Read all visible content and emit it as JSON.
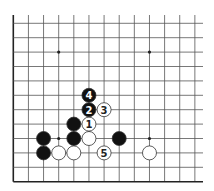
{
  "diagram": {
    "type": "go-board-fragment",
    "columns": 13,
    "rows": 12,
    "origin_x": 13.3,
    "origin_y": 23.3,
    "spacing_x": 15.13,
    "spacing_y": 14.4,
    "top_edge_y": 15,
    "right_edge_x": 203,
    "edges": {
      "left": "board-edge",
      "bottom": "board-edge",
      "top": "open",
      "right": "open"
    },
    "colors": {
      "line": "#555555",
      "edge": "#222222",
      "black": "#111111",
      "white": "#ffffff",
      "stone_outline": "#333333"
    },
    "hoshi": [
      {
        "col": 3,
        "row": 2
      },
      {
        "col": 9,
        "row": 2
      },
      {
        "col": 3,
        "row": 8
      },
      {
        "col": 9,
        "row": 8
      }
    ],
    "stones": [
      {
        "color": "black",
        "col": 2,
        "row": 8,
        "label": ""
      },
      {
        "color": "black",
        "col": 2,
        "row": 9,
        "label": ""
      },
      {
        "color": "white",
        "col": 3,
        "row": 9,
        "label": ""
      },
      {
        "color": "white",
        "col": 4,
        "row": 9,
        "label": ""
      },
      {
        "color": "black",
        "col": 4,
        "row": 7,
        "label": ""
      },
      {
        "color": "black",
        "col": 4,
        "row": 8,
        "label": ""
      },
      {
        "color": "white",
        "col": 5,
        "row": 8,
        "label": ""
      },
      {
        "color": "white",
        "col": 5,
        "row": 7,
        "label": "1"
      },
      {
        "color": "black",
        "col": 5,
        "row": 6,
        "label": "2"
      },
      {
        "color": "white",
        "col": 6,
        "row": 6,
        "label": "3"
      },
      {
        "color": "black",
        "col": 5,
        "row": 5,
        "label": "4"
      },
      {
        "color": "white",
        "col": 6,
        "row": 9,
        "label": "5"
      },
      {
        "color": "black",
        "col": 7,
        "row": 8,
        "label": ""
      },
      {
        "color": "white",
        "col": 9,
        "row": 9,
        "label": ""
      }
    ]
  }
}
